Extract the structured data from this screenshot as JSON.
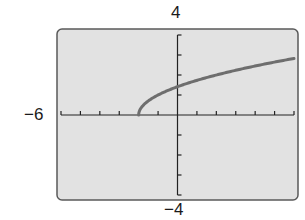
{
  "window": {
    "xmin_label": "−6",
    "ymax_label": "4",
    "ymin_label": "−4"
  },
  "colors": {
    "screen_bg": "#e2e2e2",
    "frame": "#5a5a5a",
    "axis": "#222222",
    "curve": "#6e6e6e"
  },
  "chart_data": {
    "type": "line",
    "title": "",
    "xlabel": "",
    "ylabel": "",
    "xlim": [
      -6,
      6
    ],
    "ylim": [
      -4,
      4
    ],
    "xscale": 1,
    "yscale": 1,
    "grid": false,
    "legend": null,
    "function": "y = sqrt(x + 2)",
    "series": [
      {
        "name": "f(x)",
        "x": [
          -2,
          -1.5,
          -1,
          0,
          1,
          2,
          3,
          4,
          5,
          6
        ],
        "y": [
          0,
          0.71,
          1.0,
          1.41,
          1.73,
          2.0,
          2.24,
          2.45,
          2.65,
          2.83
        ]
      }
    ],
    "annotations": [
      "-6 (Xmin)",
      "4 (Ymax)",
      "-4 (Ymin)"
    ]
  }
}
